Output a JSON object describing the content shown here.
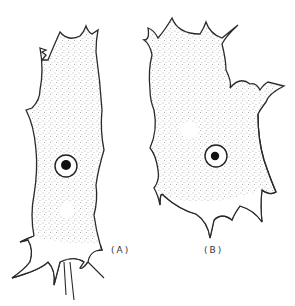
{
  "figure": {
    "panels": [
      {
        "id": "A",
        "label": "(A)",
        "shape": "elongated vertical cell",
        "has_nucleus": true,
        "has_vacuole": true
      },
      {
        "id": "B",
        "label": "(B)",
        "shape": "broad irregular cell with notch on right",
        "has_nucleus": true,
        "has_vacuole": true
      }
    ],
    "colors": {
      "background": "#ffffff",
      "outline": "#2a2a2a",
      "stipple": "#555555",
      "nucleolus": "#111111"
    }
  }
}
